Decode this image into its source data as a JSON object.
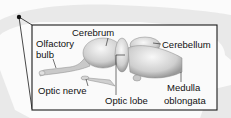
{
  "diagram": {
    "labels": {
      "cerebrum": "Cerebrum",
      "olfactory_line1": "Olfactory",
      "olfactory_line2": "bulb",
      "cerebellum": "Cerebellum",
      "optic_nerve": "Optic nerve",
      "optic_lobe": "Optic lobe",
      "medulla_line1": "Medulla",
      "medulla_line2": "oblongata"
    },
    "colors": {
      "frame": "#1a1a1a",
      "brain_fill": "#d9d9d9",
      "brain_highlight": "#f2f2f2",
      "silhouette": "#e6e6e6"
    }
  }
}
